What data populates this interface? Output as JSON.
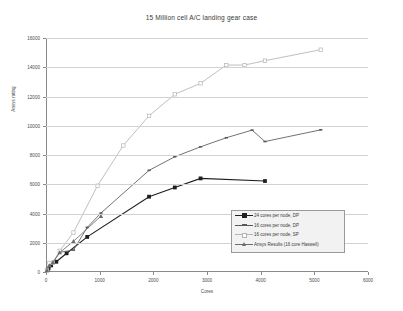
{
  "chart_data": {
    "type": "line",
    "title": "15 Million cell A/C landing gear case",
    "xlabel": "Cores",
    "ylabel": "Ansys rating",
    "xlim": [
      0,
      6000
    ],
    "ylim": [
      0,
      16000
    ],
    "xticks": [
      0,
      1000,
      2000,
      3000,
      4000,
      5000,
      6000
    ],
    "yticks": [
      0,
      2000,
      4000,
      6000,
      8000,
      10000,
      12000,
      14000,
      16000
    ],
    "grid": "horizontal",
    "legend_position": "inside-lower-right",
    "series": [
      {
        "name": "24 cores per node, DP",
        "color": "#1f1f1f",
        "marker": "square",
        "points": [
          {
            "x": 24,
            "y": 120
          },
          {
            "x": 48,
            "y": 240
          },
          {
            "x": 96,
            "y": 450
          },
          {
            "x": 192,
            "y": 700
          },
          {
            "x": 384,
            "y": 1280
          },
          {
            "x": 768,
            "y": 2400
          },
          {
            "x": 1920,
            "y": 5150
          },
          {
            "x": 2400,
            "y": 5780
          },
          {
            "x": 2880,
            "y": 6400
          },
          {
            "x": 4080,
            "y": 6220
          }
        ]
      },
      {
        "name": "16 cores per node, DP",
        "color": "#585858",
        "marker": "dash",
        "points": [
          {
            "x": 16,
            "y": 100
          },
          {
            "x": 32,
            "y": 230
          },
          {
            "x": 64,
            "y": 430
          },
          {
            "x": 128,
            "y": 640
          },
          {
            "x": 256,
            "y": 1350
          },
          {
            "x": 512,
            "y": 1500
          },
          {
            "x": 768,
            "y": 3050
          },
          {
            "x": 1024,
            "y": 4030
          },
          {
            "x": 1920,
            "y": 6950
          },
          {
            "x": 2400,
            "y": 7880
          },
          {
            "x": 2880,
            "y": 8560
          },
          {
            "x": 3360,
            "y": 9180
          },
          {
            "x": 3840,
            "y": 9700
          },
          {
            "x": 4080,
            "y": 8920
          },
          {
            "x": 5120,
            "y": 9720
          }
        ]
      },
      {
        "name": "16 cores per node, SP",
        "color": "#b4b4b4",
        "marker": "square-open",
        "points": [
          {
            "x": 16,
            "y": 140
          },
          {
            "x": 64,
            "y": 620
          },
          {
            "x": 128,
            "y": 640
          },
          {
            "x": 256,
            "y": 1450
          },
          {
            "x": 512,
            "y": 2700
          },
          {
            "x": 960,
            "y": 5900
          },
          {
            "x": 1440,
            "y": 8650
          },
          {
            "x": 1920,
            "y": 10680
          },
          {
            "x": 2400,
            "y": 12150
          },
          {
            "x": 2880,
            "y": 12900
          },
          {
            "x": 3360,
            "y": 14150
          },
          {
            "x": 3700,
            "y": 14150
          },
          {
            "x": 4080,
            "y": 14450
          },
          {
            "x": 5120,
            "y": 15200
          }
        ]
      },
      {
        "name": "Ansys Results (16 core Haswell)",
        "color": "#6b6b6b",
        "marker": "triangle",
        "points": [
          {
            "x": 16,
            "y": 110
          },
          {
            "x": 64,
            "y": 440
          },
          {
            "x": 128,
            "y": 660
          },
          {
            "x": 256,
            "y": 1330
          },
          {
            "x": 512,
            "y": 2100
          },
          {
            "x": 1024,
            "y": 3820
          }
        ]
      }
    ]
  }
}
